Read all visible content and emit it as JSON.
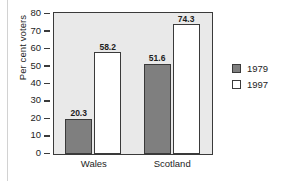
{
  "chart_data": {
    "type": "bar",
    "title": "",
    "xlabel": "",
    "ylabel": "Per cent voters",
    "categories": [
      "Wales",
      "Scotland"
    ],
    "series": [
      {
        "name": "1979",
        "values": [
          20.3,
          51.6
        ],
        "color": "#7f7f7f"
      },
      {
        "name": "1997",
        "values": [
          58.2,
          74.3
        ],
        "color": "#ffffff"
      }
    ],
    "ylim": [
      0,
      80
    ],
    "ytick_step": 10,
    "yticks": [
      0,
      10,
      20,
      30,
      40,
      50,
      60,
      70,
      80
    ],
    "ytick_labels": [
      "0",
      "10",
      "20",
      "30",
      "40",
      "50",
      "60",
      "70",
      "80"
    ],
    "data_labels": [
      "20.3",
      "58.2",
      "51.6",
      "74.3"
    ],
    "grid": false,
    "legend_position": "right",
    "legend_entries": [
      "1979",
      "1997"
    ],
    "plot_background": "#e9e9e9",
    "axis_color": "#3a3a3a"
  }
}
